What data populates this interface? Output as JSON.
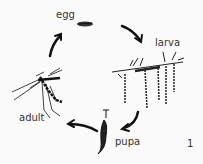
{
  "diagram": {
    "stages": [
      {
        "label": "egg"
      },
      {
        "label": "larva"
      },
      {
        "label": "pupa"
      },
      {
        "label": "adult"
      }
    ],
    "figure_number": "1"
  }
}
